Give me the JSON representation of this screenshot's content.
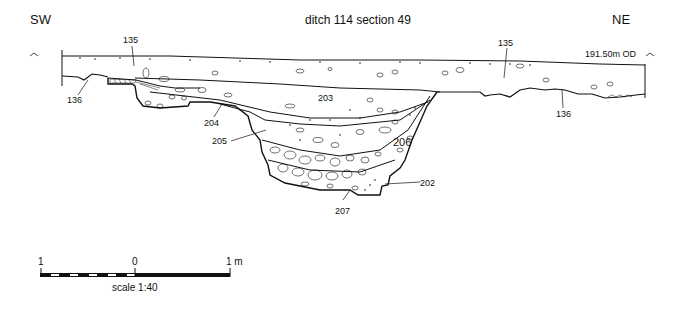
{
  "title": "ditch 114 section  49",
  "orientation": {
    "left": "SW",
    "right": "NE"
  },
  "datum": "191.50m OD",
  "contexts": {
    "c135_left": "135",
    "c135_right": "135",
    "c136_left": "136",
    "c136_right": "136",
    "c203": "203",
    "c204": "204",
    "c205": "205",
    "c206": "206",
    "c202": "202",
    "c207": "207"
  },
  "scale_bar": {
    "left_label": "1",
    "zero_label": "0",
    "right_label": "1 m",
    "caption": "scale 1:40"
  },
  "colors": {
    "ink": "#111111",
    "background": "#ffffff"
  }
}
